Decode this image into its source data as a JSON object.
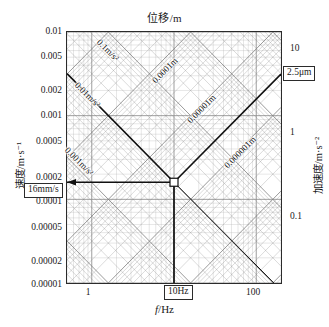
{
  "titles": {
    "top": "位移/m",
    "bottom_x": "f/Hz",
    "bottom_x_italic": "f",
    "bottom_x_rest": "/Hz",
    "left": "速度/m·s⁻¹",
    "right": "加速度/m·s⁻²"
  },
  "axes": {
    "x": {
      "label": "f/Hz",
      "scale": "log",
      "min": 0.5,
      "max": 200,
      "ticks": [
        "1",
        "10Hz",
        "100"
      ],
      "tick_values": [
        1,
        10,
        100
      ]
    },
    "y_left": {
      "label": "速度/m·s⁻¹",
      "scale": "log",
      "min": 1e-05,
      "max": 0.01,
      "ticks": [
        "0.01",
        "0.005",
        "0.002",
        "0.001",
        "0.0005",
        "0.0002",
        "0.0001",
        "0.00005",
        "0.00002",
        "0.00001"
      ],
      "tick_values": [
        0.01,
        0.005,
        0.002,
        0.001,
        0.0005,
        0.0002,
        0.0001,
        5e-05,
        2e-05,
        1e-05
      ]
    },
    "y_right": {
      "label": "加速度/m·s⁻²",
      "scale": "log",
      "ticks": [
        "10",
        "1",
        "0.1"
      ],
      "tick_values": [
        10,
        1,
        0.1
      ]
    }
  },
  "callouts": [
    {
      "name": "velocity-callout",
      "text": "16mm/s"
    },
    {
      "name": "displacement-callout",
      "text": "2.5μm"
    },
    {
      "name": "frequency-callout",
      "text": "10Hz"
    }
  ],
  "grid_labels": [
    {
      "text": "0.1m/s²",
      "dir": "down"
    },
    {
      "text": "0.01m/s²",
      "dir": "down"
    },
    {
      "text": "0.001m/s²",
      "dir": "down"
    },
    {
      "text": "0.0001m",
      "dir": "up"
    },
    {
      "text": "0.00001m",
      "dir": "up"
    },
    {
      "text": "0.000001m",
      "dir": "up"
    }
  ],
  "colors": {
    "frame": "#2b2b2b",
    "grid_major": "#8d8d8d",
    "grid_minor": "#b4b4b4",
    "diag_a": "#7d7d7d",
    "diag_b": "#7d7d7d",
    "bold_line": "#111111",
    "background": "#ffffff"
  },
  "chart_data": {
    "type": "line",
    "title": "位移/m",
    "subtitle": "",
    "xlabel": "f/Hz",
    "ylabel": "速度/m·s⁻¹",
    "y2label": "加速度/m·s⁻²",
    "xlim": [
      0.5,
      200
    ],
    "ylim": [
      1e-05,
      0.01
    ],
    "y2lim": [
      0.0314,
      31.4
    ],
    "xscale": "log",
    "yscale": "log",
    "grid": true,
    "legend": "none",
    "xticks": [
      1,
      10,
      100
    ],
    "xticklabels": [
      "1",
      "10Hz",
      "100"
    ],
    "yticks": [
      0.01,
      0.005,
      0.002,
      0.001,
      0.0005,
      0.0002,
      0.0001,
      5e-05,
      2e-05,
      1e-05
    ],
    "yticklabels": [
      "0.01",
      "0.005",
      "0.002",
      "0.001",
      "0.0005",
      "0.0002",
      "0.0001",
      "0.00005",
      "0.00002",
      "0.00001"
    ],
    "y2ticks": [
      10,
      1,
      0.1
    ],
    "y2ticklabels": [
      "10",
      "1",
      "0.1"
    ],
    "operating_point": {
      "f_hz": 10,
      "velocity_m_s": 0.00016,
      "displacement_m": 2.5e-06,
      "acceleration_m_s2": 0.01
    },
    "series": [
      {
        "name": "constant-acceleration-line",
        "annotation": "0.01 m/s²",
        "type": "line",
        "style": "bold",
        "x": [
          0.5,
          10
        ],
        "y": [
          0.00318,
          0.00016
        ]
      },
      {
        "name": "constant-displacement-line",
        "annotation": "2.5 μm",
        "type": "line",
        "style": "bold",
        "x": [
          10,
          200
        ],
        "y": [
          0.00016,
          0.00314
        ]
      },
      {
        "name": "velocity-readout-line",
        "annotation": "16 mm/s",
        "type": "line",
        "style": "bold-horizontal",
        "x": [
          0.5,
          10
        ],
        "y": [
          0.00016,
          0.00016
        ]
      },
      {
        "name": "frequency-readout-line",
        "annotation": "10 Hz",
        "type": "line",
        "style": "bold-vertical",
        "x": [
          10,
          10
        ],
        "y": [
          1e-05,
          0.00016
        ]
      },
      {
        "name": "descending-diagonal-guide",
        "annotation": "",
        "type": "line",
        "style": "thin",
        "x": [
          10,
          200
        ],
        "y": [
          0.00016,
          8.2e-06
        ]
      }
    ],
    "constant_acceleration_lines": [
      "0.001m/s²",
      "0.01m/s²",
      "0.1m/s²"
    ],
    "constant_displacement_lines": [
      "0.0001m",
      "0.00001m",
      "0.000001m"
    ]
  }
}
